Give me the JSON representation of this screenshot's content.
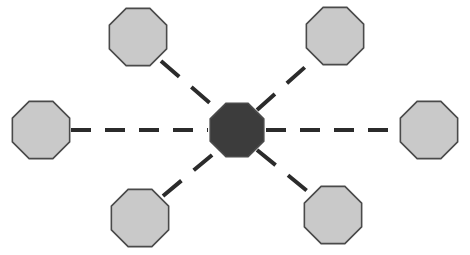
{
  "diagram": {
    "type": "node-link-diagram",
    "canvas": {
      "width": 470,
      "height": 255,
      "background_color": "#ffffff"
    },
    "style": {
      "hub_fill_color": "#3c3c3c",
      "spoke_fill_color": "#c9c9c9",
      "node_outline_color": "#4a4a4a",
      "node_outline_width": 1.6,
      "edge_color": "#2b2b2b",
      "edge_width": 4,
      "edge_style": "dashed",
      "node_shape": "octagon"
    },
    "nodes": [
      {
        "id": "hub",
        "name": "center-hub-node",
        "role": "hub",
        "label": "",
        "fill_color": "#3c3c3c",
        "cx": 237,
        "cy": 130,
        "radius": 29
      },
      {
        "id": "spoke-top-left",
        "name": "spoke-node-top-left",
        "role": "spoke",
        "label": "",
        "fill_color": "#c9c9c9",
        "cx": 138,
        "cy": 37,
        "radius": 31
      },
      {
        "id": "spoke-top-right",
        "name": "spoke-node-top-right",
        "role": "spoke",
        "label": "",
        "fill_color": "#c9c9c9",
        "cx": 335,
        "cy": 36,
        "radius": 31
      },
      {
        "id": "spoke-left",
        "name": "spoke-node-left",
        "role": "spoke",
        "label": "",
        "fill_color": "#c9c9c9",
        "cx": 41,
        "cy": 130,
        "radius": 31
      },
      {
        "id": "spoke-right",
        "name": "spoke-node-right",
        "role": "spoke",
        "label": "",
        "fill_color": "#c9c9c9",
        "cx": 429,
        "cy": 130,
        "radius": 31
      },
      {
        "id": "spoke-bottom-left",
        "name": "spoke-node-bottom-left",
        "role": "spoke",
        "label": "",
        "fill_color": "#c9c9c9",
        "cx": 140,
        "cy": 218,
        "radius": 31
      },
      {
        "id": "spoke-bottom-right",
        "name": "spoke-node-bottom-right",
        "role": "spoke",
        "label": "",
        "fill_color": "#c9c9c9",
        "cx": 333,
        "cy": 215,
        "radius": 31
      }
    ],
    "edges": [
      {
        "id": "edge-hub-left",
        "name": "edge-hub-to-left",
        "from": "spoke-left",
        "to": "hub",
        "x1": 71,
        "y1": 130,
        "x2": 208,
        "y2": 130,
        "dash_pattern": "20 14"
      },
      {
        "id": "edge-hub-right",
        "name": "edge-hub-to-right",
        "from": "hub",
        "to": "spoke-right",
        "x1": 266,
        "y1": 130,
        "x2": 399,
        "y2": 130,
        "dash_pattern": "20 14"
      },
      {
        "id": "edge-hub-top-left",
        "name": "edge-hub-to-top-left",
        "from": "spoke-top-left",
        "to": "hub",
        "x1": 161,
        "y1": 61,
        "x2": 218,
        "y2": 110,
        "dash_pattern": "24 16"
      },
      {
        "id": "edge-hub-top-right",
        "name": "edge-hub-to-top-right",
        "from": "hub",
        "to": "spoke-top-right",
        "x1": 257,
        "y1": 110,
        "x2": 313,
        "y2": 60,
        "dash_pattern": "24 16"
      },
      {
        "id": "edge-hub-bottom-left",
        "name": "edge-hub-to-bottom-left",
        "from": "spoke-bottom-left",
        "to": "hub",
        "x1": 163,
        "y1": 196,
        "x2": 218,
        "y2": 150,
        "dash_pattern": "24 16"
      },
      {
        "id": "edge-hub-bottom-right",
        "name": "edge-hub-to-bottom-right",
        "from": "hub",
        "to": "spoke-bottom-right",
        "x1": 257,
        "y1": 150,
        "x2": 311,
        "y2": 194,
        "dash_pattern": "24 16"
      }
    ]
  }
}
